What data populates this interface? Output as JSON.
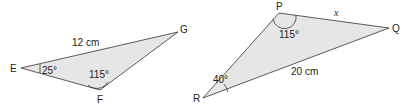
{
  "colors": {
    "fill": "#e6e6e6",
    "stroke": "#333333"
  },
  "triangle1": {
    "vertices": {
      "E": "E",
      "F": "F",
      "G": "G"
    },
    "side_EG": "12 cm",
    "angle_E": "25°",
    "angle_F": "115°"
  },
  "triangle2": {
    "vertices": {
      "P": "P",
      "Q": "Q",
      "R": "R"
    },
    "side_PQ": "x",
    "side_RQ": "20 cm",
    "angle_P": "115°",
    "angle_R": "40°"
  }
}
